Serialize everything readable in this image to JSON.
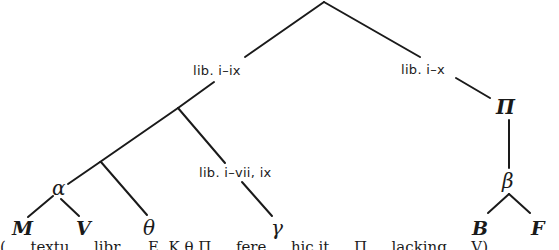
{
  "diagram": {
    "type": "stemma codicum (manuscript tree)",
    "nodes": {
      "archetype": {
        "label": ""
      },
      "lib_i_ix": {
        "label": "lib. i–ix"
      },
      "lib_i_x": {
        "label": "lib. i–x"
      },
      "lib_i_vii_ix": {
        "label": "lib. i–vii, ix"
      },
      "alpha": {
        "label": "α"
      },
      "pi": {
        "label": "Π"
      },
      "beta": {
        "label": "β"
      },
      "M": {
        "label": "M"
      },
      "V": {
        "label": "V"
      },
      "theta": {
        "label": "θ"
      },
      "gamma": {
        "label": "γ"
      },
      "B": {
        "label": "B"
      },
      "F": {
        "label": "F"
      }
    },
    "edges": [
      [
        "archetype",
        "lib_i_ix"
      ],
      [
        "archetype",
        "lib_i_x"
      ],
      [
        "lib_i_ix",
        "junction_1"
      ],
      [
        "junction_1",
        "junction_2"
      ],
      [
        "junction_1",
        "lib_i_vii_ix"
      ],
      [
        "lib_i_vii_ix",
        "gamma"
      ],
      [
        "junction_2",
        "alpha"
      ],
      [
        "junction_2",
        "theta"
      ],
      [
        "alpha",
        "M"
      ],
      [
        "alpha",
        "V"
      ],
      [
        "lib_i_x",
        "pi"
      ],
      [
        "pi",
        "beta"
      ],
      [
        "beta",
        "B"
      ],
      [
        "beta",
        "F"
      ]
    ],
    "caption_clipped": "( … textu … libr. … E, K θ Π … fere … hic it … Π … lacking … V)"
  }
}
